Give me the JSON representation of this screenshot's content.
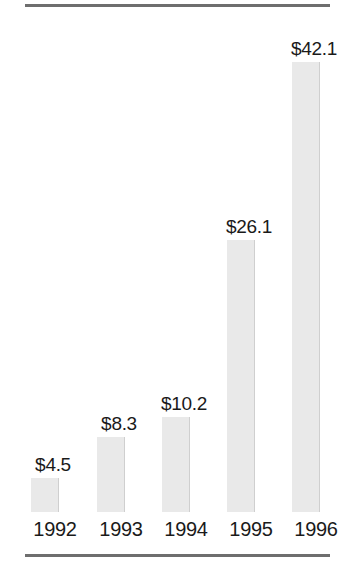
{
  "chart_data": {
    "type": "bar",
    "title": "",
    "subtitle": "",
    "xlabel": "",
    "ylabel": "",
    "categories": [
      "1992",
      "1993",
      "1994",
      "1995",
      "1996"
    ],
    "values": [
      4.5,
      8.3,
      10.2,
      26.1,
      42.1
    ],
    "data_labels": [
      "$4.5",
      "$8.3",
      "$10.2",
      "$26.1",
      "$42.1"
    ],
    "value_prefix": "$",
    "ylim": [
      0,
      42.1
    ],
    "grid": false,
    "legend": false,
    "legend_position": "none",
    "axis_visible": false,
    "bars": [
      {
        "category": "1992",
        "value": 4.5,
        "label": "$4.5",
        "bar_px_height": 34,
        "column_left_px": 25
      },
      {
        "category": "1993",
        "value": 8.3,
        "label": "$8.3",
        "bar_px_height": 75,
        "column_left_px": 91
      },
      {
        "category": "1994",
        "value": 10.2,
        "label": "$10.2",
        "bar_px_height": 95,
        "column_left_px": 156
      },
      {
        "category": "1995",
        "value": 26.1,
        "label": "$26.1",
        "bar_px_height": 272,
        "column_left_px": 221
      },
      {
        "category": "1996",
        "value": 42.1,
        "label": "$42.1",
        "bar_px_height": 450,
        "column_left_px": 286
      }
    ],
    "colors": {
      "bar_fill": "#e9e9e9",
      "bar_shadow": "#808080",
      "rule": "#6e6e6e",
      "text": "#1a1a1a",
      "background": "#ffffff"
    }
  }
}
